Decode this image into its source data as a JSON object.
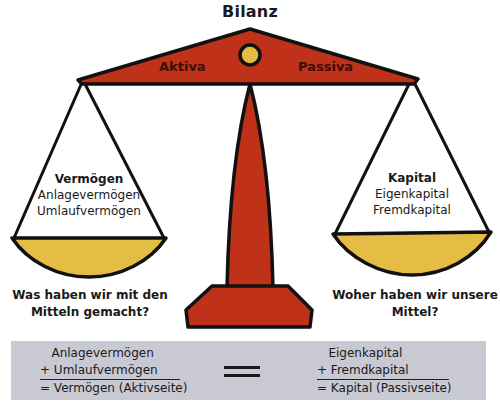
{
  "title": "Bilanz",
  "beam": {
    "left_label": "Aktiva",
    "right_label": "Passiva"
  },
  "left_pan": {
    "heading": "Vermögen",
    "items": [
      "Anlagevermögen",
      "Umlaufvermögen"
    ],
    "question_line1": "Was haben wir mit den",
    "question_line2": "Mitteln gemacht?"
  },
  "right_pan": {
    "heading": "Kapital",
    "items": [
      "Eigenkapital",
      "Fremdkapital"
    ],
    "question_line1": "Woher haben wir unsere",
    "question_line2": "Mittel?"
  },
  "formula": {
    "left": {
      "line1": "   Anlagevermögen",
      "line2": "+ Umlaufvermögen",
      "result": "= Vermögen (Aktivseite)"
    },
    "equals_symbol": "=",
    "right": {
      "line1": "   Eigenkapital",
      "line2": "+ Fremdkapital",
      "result": "= Kapital (Passivseite)"
    }
  },
  "colors": {
    "red": "#c0311a",
    "gold": "#e6bd44",
    "outline": "#111111",
    "panel_gray": "#c9c9d3"
  }
}
